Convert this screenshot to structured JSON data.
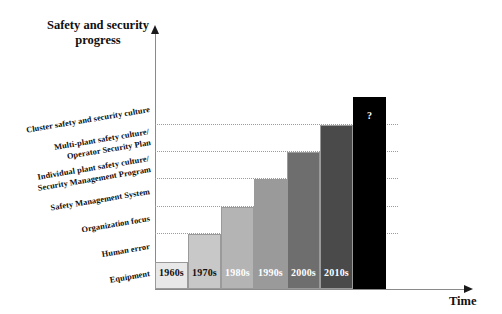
{
  "chart_data": {
    "type": "bar",
    "title": "Safety and security\nprogress",
    "xlabel": "Time",
    "ylabel": "",
    "grid": true,
    "legend": "none",
    "categories": [
      "1960s",
      "1970s",
      "1980s",
      "1990s",
      "2000s",
      "2010s",
      "?"
    ],
    "values": [
      1,
      2,
      3,
      4,
      5,
      6,
      7
    ],
    "ylim": [
      0,
      7.5
    ],
    "y_tick_labels": [
      "Equipment",
      "Human error",
      "Organization focus",
      "Safety Management System",
      "Individual plant safety culture/\nSecurity Management Program",
      "Multi-plant safety culture/\nOperator Security Plan",
      "Cluster safety and security culture"
    ],
    "bar_colors": [
      "#e8e8e8",
      "#c8c8c8",
      "#b4b4b4",
      "#9a9a9a",
      "#6e6e6e",
      "#4a4a4a",
      "#000000"
    ],
    "bar_label_colors": [
      "#101010",
      "#101010",
      "#ffffff",
      "#ffffff",
      "#ffffff",
      "#ffffff",
      "#ffffff"
    ],
    "annotation": "?"
  },
  "figure": {
    "title_lines": "Safety and security\nprogress",
    "x_axis_label": "Time",
    "background": "#ffffff",
    "axis_color": "#8a8a8a",
    "gridline_color": "#9c9c9c"
  },
  "bars": [
    {
      "label": "1960s",
      "step": 1
    },
    {
      "label": "1970s",
      "step": 2
    },
    {
      "label": "1980s",
      "step": 3
    },
    {
      "label": "1990s",
      "step": 4
    },
    {
      "label": "2000s",
      "step": 5
    },
    {
      "label": "2010s",
      "step": 6
    },
    {
      "label": "?",
      "step": 7
    }
  ],
  "category_labels": [
    {
      "text": "Cluster safety and security culture"
    },
    {
      "text": "Multi-plant safety culture/\nOperator Security Plan"
    },
    {
      "text": "Individual plant safety culture/\nSecurity Management Program"
    },
    {
      "text": "Safety Management System"
    },
    {
      "text": "Organization focus"
    },
    {
      "text": "Human error"
    },
    {
      "text": "Equipment"
    }
  ]
}
